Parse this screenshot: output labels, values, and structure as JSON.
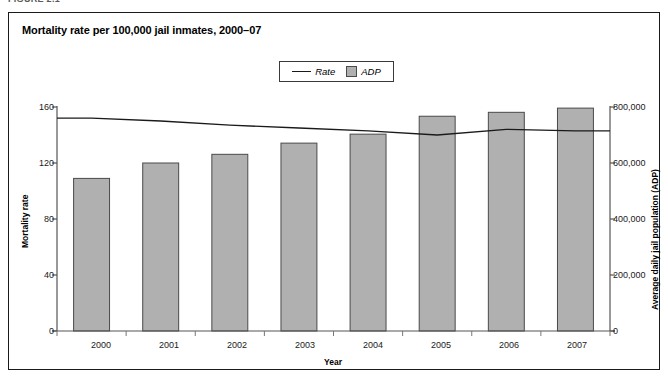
{
  "figure_label": "FIGURE 2.1",
  "chart": {
    "title": "Mortality rate per 100,000 jail inmates, 2000–07",
    "legend": {
      "position": "top-center",
      "entries": [
        {
          "label": "Rate",
          "marker": "line",
          "color": "#1a1a1a"
        },
        {
          "label": "ADP",
          "marker": "square",
          "color": "#b0b0b0"
        }
      ]
    }
  },
  "chart_data": {
    "type": "bar",
    "title": "Mortality rate per 100,000 jail inmates, 2000–07",
    "xlabel": "Year",
    "ylabel": "Mortality rate",
    "y2label": "Average daily jail population (ADP)",
    "categories": [
      "2000",
      "2001",
      "2002",
      "2003",
      "2004",
      "2005",
      "2006",
      "2007"
    ],
    "ylim": [
      0,
      160
    ],
    "y2lim": [
      0,
      800000
    ],
    "yticks": [
      0,
      40,
      80,
      120,
      160
    ],
    "yticklabels": [
      "0",
      "40",
      "80",
      "120",
      "160"
    ],
    "y2ticks": [
      0,
      200000,
      400000,
      600000,
      800000
    ],
    "y2ticklabels": [
      "0",
      "200,000",
      "400,000",
      "600,000",
      "800,000"
    ],
    "grid": false,
    "series": [
      {
        "name": "ADP",
        "type": "bar",
        "axis": "right",
        "color": "#b0b0b0",
        "edge_color": "#4a4a4a",
        "values": [
          545000,
          600000,
          631000,
          671000,
          703000,
          767000,
          781000,
          796000
        ]
      },
      {
        "name": "Rate",
        "type": "line",
        "axis": "left",
        "color": "#1a1a1a",
        "values": [
          152,
          150,
          147,
          145,
          143,
          140,
          144,
          143
        ]
      }
    ]
  }
}
